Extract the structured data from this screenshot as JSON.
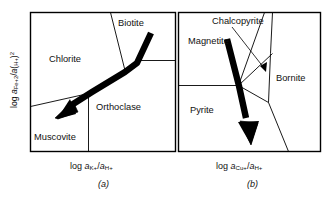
{
  "figure": {
    "kind": "activity-activity mineral stability diagram pair",
    "panels": [
      {
        "tag": "(a)",
        "xlabel_parts": {
          "prefix": "log ",
          "a1": "a",
          "sub1": "K+",
          "slash": "/",
          "a2": "a",
          "sub2": "H+"
        },
        "xlabel_plain": "log aK+/aH+",
        "fields": [
          {
            "name": "Chlorite",
            "x": 49,
            "y": 55
          },
          {
            "name": "Biotite",
            "x": 118,
            "y": 19
          },
          {
            "name": "Orthoclase",
            "x": 109,
            "y": 103
          },
          {
            "name": "Muscovite",
            "x": 38,
            "y": 133
          }
        ]
      },
      {
        "tag": "(b)",
        "xlabel_parts": {
          "prefix": "log ",
          "a1": "a",
          "sub1": "Cu+",
          "slash": "/",
          "a2": "a",
          "sub2": "H+"
        },
        "xlabel_plain": "log aCu+/aH+",
        "fields": [
          {
            "name": "Magnetite",
            "x": 190,
            "y": 37
          },
          {
            "name": "Chalcopyrite",
            "x": 214,
            "y": 19
          },
          {
            "name": "Bornite",
            "x": 277,
            "y": 76
          },
          {
            "name": "Pyrite",
            "x": 191,
            "y": 106
          }
        ]
      }
    ],
    "ylabel_parts": {
      "prefix": "log ",
      "a1": "a",
      "sub1": "Fe+2",
      "slash": "/",
      "a2": "a",
      "paren_open": "(",
      "sub_h": "H+",
      "paren_close": ")",
      "exp": "2"
    },
    "ylabel_plain": "log aFe+2/a(H+)2",
    "colors": {
      "ink": "#111111",
      "frame": "#000000",
      "field_boundary": "#000000",
      "reaction_path": "#000000",
      "background": "#ffffff"
    },
    "reaction_paths": [
      {
        "panel": "(a)",
        "description": "thick black reaction-path arrow from Biotite field down-left into Muscovite field",
        "polyline": "151,35 137,64 125,72 92,92 72,109",
        "arrow_tip": "59,118"
      },
      {
        "panel": "(b)",
        "description": "thick black reaction-path arrow from Magnetite field down into Pyrite field",
        "polyline": "228,41 239,86 247,122",
        "arrow_tip": "252,143"
      }
    ],
    "leaders": [
      {
        "panel": "(b)",
        "description": "thin leader line from Chalcopyrite label to narrow Chalcopyrite field",
        "from": "232,26",
        "to": "266,70"
      }
    ]
  }
}
